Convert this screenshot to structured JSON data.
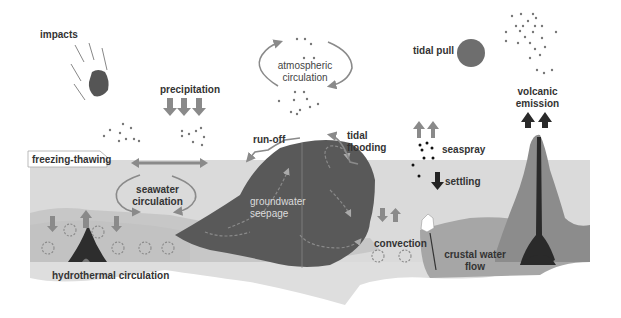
{
  "diagram": {
    "title": "",
    "colors": {
      "background": "#ffffff",
      "sea": "#d9d9d9",
      "sea_floor_light": "#c2c2c2",
      "crust_mid": "#b0b0b0",
      "island": "#555555",
      "volcano": "#8c8c8c",
      "magma": "#2a2a2a",
      "arrow_gray": "#8a8a8a",
      "arrow_dark": "#333333",
      "moon": "#6e6e6e",
      "text": "#333333"
    },
    "labels": {
      "impacts": "impacts",
      "precipitation": "precipitation",
      "atmospheric_circulation_1": "atmospheric",
      "atmospheric_circulation_2": "circulation",
      "tidal_pull": "tidal pull",
      "volcanic_emission_1": "volcanic",
      "volcanic_emission_2": "emission",
      "run_off": "run-off",
      "tidal_flooding_1": "tidal",
      "tidal_flooding_2": "flooding",
      "seaspray": "seaspray",
      "settling": "settling",
      "freezing_thawing": "freezing-thawing",
      "seawater_circulation_1": "seawater",
      "seawater_circulation_2": "circulation",
      "groundwater_seepage_1": "groundwater",
      "groundwater_seepage_2": "seepage",
      "convection": "convection",
      "crustal_water_flow_1": "crustal water",
      "crustal_water_flow_2": "flow",
      "hydrothermal_circulation": "hydrothermal circulation"
    },
    "icons": {
      "meteor": "meteor-icon",
      "moon": "moon-icon",
      "particles": "particle-dots-icon",
      "circulation": "circular-arrow-icon",
      "up_arrow": "up-arrow-icon",
      "down_arrow": "down-arrow-icon",
      "double_arrow": "double-headed-arrow-icon"
    }
  }
}
